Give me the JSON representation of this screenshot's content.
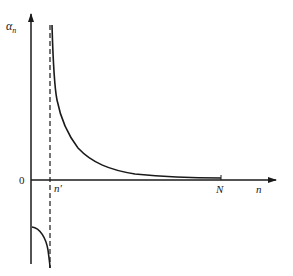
{
  "diagram": {
    "y_axis_label": "α",
    "y_axis_subscript": "n",
    "x_axis_label": "n",
    "origin_label": "0",
    "asymptote_label": "n′",
    "end_label": "N",
    "colors": {
      "line": "#1a1a1a",
      "background": "#ffffff"
    }
  }
}
